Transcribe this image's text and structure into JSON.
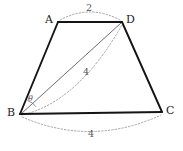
{
  "figure": {
    "kind": "geometry-diagram",
    "shape_name": "trapezoid-ABCD",
    "background_color": "#ffffff",
    "stroke_color": "#141414",
    "diagonal_color": "#6e6e6e",
    "arc_color": "#9a9a9a",
    "label_color": "#1a1a1a",
    "measure_color": "#555555"
  },
  "vertices": [
    {
      "id": "A",
      "label": "A",
      "x": 58,
      "y": 22,
      "label_x": 45,
      "label_y": 15
    },
    {
      "id": "D",
      "label": "D",
      "x": 122,
      "y": 22,
      "label_x": 126,
      "label_y": 15
    },
    {
      "id": "B",
      "label": "B",
      "x": 20,
      "y": 114,
      "label_x": 7,
      "label_y": 108
    },
    {
      "id": "C",
      "label": "C",
      "x": 162,
      "y": 112,
      "label_x": 166,
      "label_y": 106
    }
  ],
  "sides": [
    {
      "name": "AD",
      "from": "A",
      "to": "D",
      "style": "solid"
    },
    {
      "name": "AB",
      "from": "A",
      "to": "B",
      "style": "solid"
    },
    {
      "name": "BC",
      "from": "B",
      "to": "C",
      "style": "solid"
    },
    {
      "name": "DC",
      "from": "D",
      "to": "C",
      "style": "solid"
    }
  ],
  "diagonal": {
    "name": "BD",
    "from": "B",
    "to": "D",
    "style": "solid-gray"
  },
  "measures": [
    {
      "id": "AD",
      "value": "2",
      "x": 88,
      "y": 7,
      "arc": "A-D"
    },
    {
      "id": "BD",
      "value": "4",
      "x": 85,
      "y": 71,
      "arc": "B-D"
    },
    {
      "id": "BC",
      "value": "4",
      "x": 90,
      "y": 132,
      "arc": "B-C"
    }
  ],
  "angle": {
    "id": "theta-at-B",
    "label": "θ",
    "vertex": "B",
    "between": [
      "BA",
      "BD"
    ],
    "label_x": 28,
    "label_y": 98
  }
}
